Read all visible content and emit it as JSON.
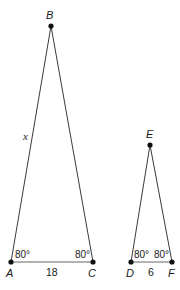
{
  "diagram": {
    "type": "similar-triangles",
    "triangles": [
      {
        "id": "ABC",
        "vertices": {
          "A": {
            "label": "A",
            "x": 11,
            "y": 262
          },
          "B": {
            "label": "B",
            "x": 51,
            "y": 26
          },
          "C": {
            "label": "C",
            "x": 93,
            "y": 262
          }
        },
        "angles": {
          "A": "80°",
          "C": "80°"
        },
        "sides": {
          "AB": "x",
          "AC": "18"
        }
      },
      {
        "id": "DEF",
        "vertices": {
          "D": {
            "label": "D",
            "x": 131,
            "y": 262
          },
          "E": {
            "label": "E",
            "x": 150,
            "y": 145
          },
          "F": {
            "label": "F",
            "x": 172,
            "y": 262
          }
        },
        "angles": {
          "D": "80°",
          "F": "80°"
        },
        "sides": {
          "DF": "6"
        }
      }
    ]
  }
}
